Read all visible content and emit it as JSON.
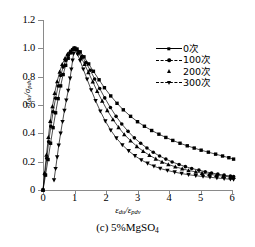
{
  "caption": {
    "text": "(c) 5%MgSO",
    "sub": "4"
  },
  "axes": {
    "x_title_main": "ε",
    "x_title_sub1": "du",
    "x_title_slash": "/ε",
    "x_title_sub2": "pdv",
    "y_title_main": "σ",
    "y_title_sub1": "du",
    "y_title_slash": "/σ",
    "y_title_sub2": "pdv",
    "x_ticks": [
      "0",
      "1",
      "2",
      "3",
      "4",
      "5",
      "6"
    ],
    "y_ticks": [
      "0",
      "0.2",
      "0.4",
      "0.6",
      "0.8",
      "1.0",
      "1.2"
    ]
  },
  "legend": {
    "items": [
      {
        "label": "0次",
        "marker": "square",
        "line": "solid"
      },
      {
        "label": "100次",
        "marker": "circle",
        "line": "dash"
      },
      {
        "label": "200次",
        "marker": "triangle-up",
        "line": "none"
      },
      {
        "label": "300次",
        "marker": "triangle-down",
        "line": "dash"
      }
    ]
  },
  "chart_data": {
    "type": "line",
    "title": "(c) 5%MgSO4",
    "xlabel": "εdu/εpdv",
    "ylabel": "σdu/σpdv",
    "xlim": [
      0,
      6
    ],
    "ylim": [
      0,
      1.2
    ],
    "grid": false,
    "legend_position": "top-right",
    "series": [
      {
        "name": "0次",
        "marker": "square",
        "points": [
          [
            0.0,
            0.0
          ],
          [
            0.08,
            0.105
          ],
          [
            0.16,
            0.215
          ],
          [
            0.24,
            0.33
          ],
          [
            0.32,
            0.44
          ],
          [
            0.4,
            0.545
          ],
          [
            0.48,
            0.645
          ],
          [
            0.56,
            0.735
          ],
          [
            0.64,
            0.815
          ],
          [
            0.72,
            0.88
          ],
          [
            0.8,
            0.93
          ],
          [
            0.88,
            0.968
          ],
          [
            0.94,
            0.99
          ],
          [
            1.0,
            1.0
          ],
          [
            1.08,
            0.995
          ],
          [
            1.18,
            0.975
          ],
          [
            1.3,
            0.94
          ],
          [
            1.45,
            0.89
          ],
          [
            1.6,
            0.838
          ],
          [
            1.78,
            0.778
          ],
          [
            1.95,
            0.722
          ],
          [
            2.15,
            0.664
          ],
          [
            2.35,
            0.612
          ],
          [
            2.55,
            0.566
          ],
          [
            2.78,
            0.52
          ],
          [
            3.0,
            0.482
          ],
          [
            3.22,
            0.45
          ],
          [
            3.45,
            0.42
          ],
          [
            3.68,
            0.394
          ],
          [
            3.9,
            0.371
          ],
          [
            4.12,
            0.35
          ],
          [
            4.35,
            0.33
          ],
          [
            4.58,
            0.312
          ],
          [
            4.8,
            0.296
          ],
          [
            5.02,
            0.281
          ],
          [
            5.25,
            0.267
          ],
          [
            5.48,
            0.253
          ],
          [
            5.7,
            0.24
          ],
          [
            5.9,
            0.228
          ],
          [
            6.05,
            0.218
          ]
        ]
      },
      {
        "name": "100次",
        "marker": "circle",
        "points": [
          [
            0.0,
            0.0
          ],
          [
            0.06,
            0.11
          ],
          [
            0.12,
            0.225
          ],
          [
            0.18,
            0.34
          ],
          [
            0.25,
            0.45
          ],
          [
            0.32,
            0.552
          ],
          [
            0.4,
            0.648
          ],
          [
            0.48,
            0.734
          ],
          [
            0.56,
            0.808
          ],
          [
            0.64,
            0.868
          ],
          [
            0.72,
            0.915
          ],
          [
            0.8,
            0.952
          ],
          [
            0.88,
            0.978
          ],
          [
            0.95,
            0.994
          ],
          [
            1.0,
            1.0
          ],
          [
            1.06,
            0.994
          ],
          [
            1.14,
            0.975
          ],
          [
            1.24,
            0.944
          ],
          [
            1.36,
            0.9
          ],
          [
            1.5,
            0.845
          ],
          [
            1.64,
            0.784
          ],
          [
            1.8,
            0.716
          ],
          [
            1.96,
            0.65
          ],
          [
            2.14,
            0.582
          ],
          [
            2.32,
            0.52
          ],
          [
            2.5,
            0.466
          ],
          [
            2.7,
            0.414
          ],
          [
            2.9,
            0.368
          ],
          [
            3.1,
            0.33
          ],
          [
            3.3,
            0.296
          ],
          [
            3.5,
            0.266
          ],
          [
            3.7,
            0.24
          ],
          [
            3.9,
            0.218
          ],
          [
            4.1,
            0.198
          ],
          [
            4.32,
            0.18
          ],
          [
            4.52,
            0.165
          ],
          [
            4.72,
            0.152
          ],
          [
            4.95,
            0.14
          ],
          [
            5.15,
            0.129
          ],
          [
            5.35,
            0.12
          ],
          [
            5.55,
            0.112
          ],
          [
            5.75,
            0.105
          ],
          [
            5.95,
            0.098
          ],
          [
            6.05,
            0.095
          ]
        ]
      },
      {
        "name": "200次",
        "marker": "triangle-up",
        "points": [
          [
            0.0,
            0.0
          ],
          [
            0.05,
            0.12
          ],
          [
            0.11,
            0.248
          ],
          [
            0.17,
            0.372
          ],
          [
            0.23,
            0.486
          ],
          [
            0.3,
            0.59
          ],
          [
            0.37,
            0.684
          ],
          [
            0.45,
            0.766
          ],
          [
            0.53,
            0.834
          ],
          [
            0.61,
            0.888
          ],
          [
            0.7,
            0.93
          ],
          [
            0.78,
            0.96
          ],
          [
            0.86,
            0.98
          ],
          [
            0.94,
            0.994
          ],
          [
            1.0,
            1.0
          ],
          [
            1.05,
            0.992
          ],
          [
            1.12,
            0.97
          ],
          [
            1.21,
            0.935
          ],
          [
            1.32,
            0.888
          ],
          [
            1.44,
            0.83
          ],
          [
            1.58,
            0.765
          ],
          [
            1.72,
            0.697
          ],
          [
            1.88,
            0.628
          ],
          [
            2.04,
            0.562
          ],
          [
            2.22,
            0.498
          ],
          [
            2.4,
            0.442
          ],
          [
            2.58,
            0.392
          ],
          [
            2.78,
            0.348
          ],
          [
            2.98,
            0.308
          ],
          [
            3.18,
            0.274
          ],
          [
            3.38,
            0.245
          ],
          [
            3.58,
            0.22
          ],
          [
            3.78,
            0.198
          ],
          [
            3.98,
            0.18
          ],
          [
            4.2,
            0.164
          ],
          [
            4.42,
            0.15
          ],
          [
            4.62,
            0.138
          ],
          [
            4.85,
            0.128
          ],
          [
            5.05,
            0.119
          ],
          [
            5.28,
            0.111
          ],
          [
            5.5,
            0.104
          ],
          [
            5.72,
            0.098
          ],
          [
            5.95,
            0.092
          ],
          [
            6.05,
            0.09
          ]
        ]
      },
      {
        "name": "300次",
        "marker": "triangle-down",
        "points": [
          [
            0.35,
            0.07
          ],
          [
            0.4,
            0.15
          ],
          [
            0.45,
            0.232
          ],
          [
            0.5,
            0.315
          ],
          [
            0.56,
            0.4
          ],
          [
            0.62,
            0.482
          ],
          [
            0.68,
            0.56
          ],
          [
            0.74,
            0.634
          ],
          [
            0.8,
            0.702
          ],
          [
            0.86,
            0.788
          ],
          [
            0.9,
            0.852
          ],
          [
            0.94,
            0.915
          ],
          [
            0.97,
            0.962
          ],
          [
            1.0,
            1.0
          ],
          [
            1.04,
            0.988
          ],
          [
            1.1,
            0.958
          ],
          [
            1.18,
            0.912
          ],
          [
            1.28,
            0.852
          ],
          [
            1.4,
            0.782
          ],
          [
            1.53,
            0.706
          ],
          [
            1.67,
            0.63
          ],
          [
            1.82,
            0.556
          ],
          [
            1.98,
            0.486
          ],
          [
            2.15,
            0.422
          ],
          [
            2.33,
            0.366
          ],
          [
            2.52,
            0.318
          ],
          [
            2.72,
            0.276
          ],
          [
            2.92,
            0.241
          ],
          [
            3.12,
            0.212
          ],
          [
            3.32,
            0.188
          ],
          [
            3.52,
            0.168
          ],
          [
            3.72,
            0.152
          ],
          [
            3.95,
            0.138
          ],
          [
            4.18,
            0.126
          ],
          [
            4.4,
            0.116
          ],
          [
            4.62,
            0.108
          ],
          [
            4.85,
            0.101
          ],
          [
            5.08,
            0.095
          ],
          [
            5.3,
            0.09
          ],
          [
            5.52,
            0.085
          ],
          [
            5.75,
            0.08
          ],
          [
            5.95,
            0.076
          ],
          [
            6.05,
            0.074
          ]
        ]
      }
    ]
  }
}
